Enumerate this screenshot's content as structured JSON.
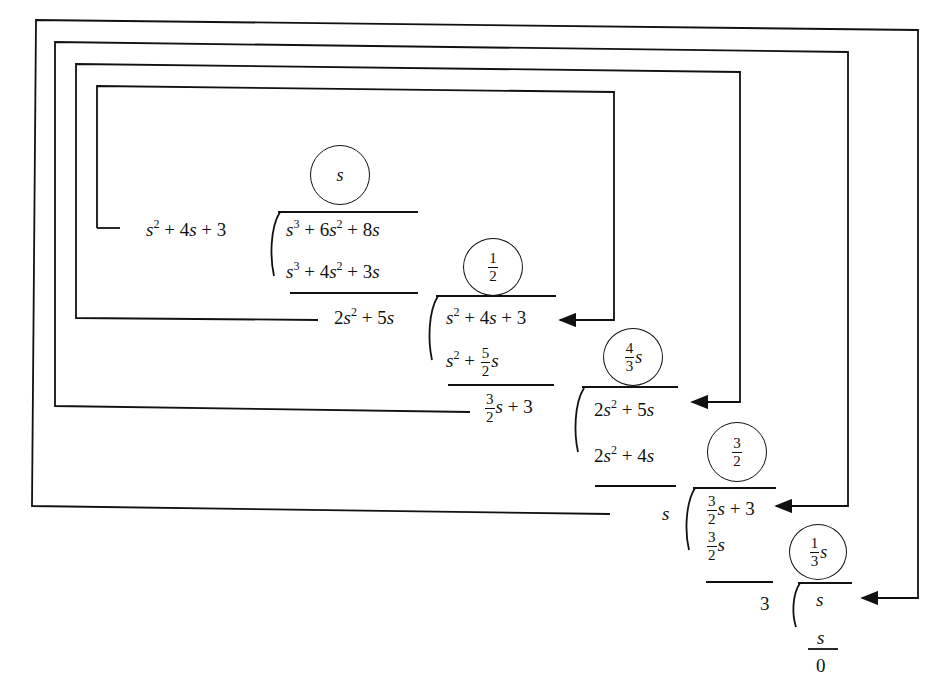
{
  "diagram": {
    "type": "continued-fraction-expansion-long-division",
    "steps": [
      {
        "divisor": "s^2 + 4s + 3",
        "dividend": "s^3 + 6s^2 + 8s",
        "quotient": "s",
        "subtract": "s^3 + 4s^2 + 3s",
        "remainder": "2s^2 + 5s"
      },
      {
        "divisor": "2s^2 + 5s",
        "dividend": "s^2 + 4s + 3",
        "quotient": "1/2",
        "subtract": "s^2 + 5/2 s",
        "remainder": "3/2 s + 3"
      },
      {
        "divisor": "3/2 s + 3",
        "dividend": "2s^2 + 5s",
        "quotient": "4/3 s",
        "subtract": "2s^2 + 4s",
        "remainder": "s"
      },
      {
        "divisor": "s",
        "dividend": "3/2 s + 3",
        "quotient": "3/2",
        "subtract": "3/2 s",
        "remainder": "3"
      },
      {
        "divisor": "3",
        "dividend": "s",
        "quotient": "1/3 s",
        "subtract": "s",
        "remainder": "0"
      }
    ],
    "labels": {
      "var": "s",
      "plus": "+",
      "two": "2",
      "three": "3",
      "four": "4",
      "five": "5",
      "six": "6",
      "eight": "8",
      "one": "1",
      "zero": "0",
      "sq": "2",
      "cube": "3"
    },
    "colors": {
      "ink": "#111111",
      "background": "#ffffff"
    }
  }
}
